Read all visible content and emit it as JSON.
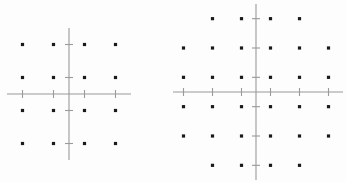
{
  "figure": {
    "title": "",
    "background_color": "#fdfdfd",
    "axis_color": "#9a9a9a",
    "point_color": "#1a1a1a"
  },
  "chart_data": [
    {
      "type": "scatter",
      "name": "16-QAM square constellation",
      "title": "",
      "xlabel": "",
      "ylabel": "",
      "xlim": [
        -4,
        4
      ],
      "ylim": [
        -4,
        4
      ],
      "grid": false,
      "legend": "none",
      "point_count": 16,
      "xticks": [
        -3,
        -1,
        1,
        3
      ],
      "yticks": [
        -3,
        -1,
        1,
        3
      ],
      "x": [
        -3,
        -1,
        1,
        3,
        -3,
        -1,
        1,
        3,
        -3,
        -1,
        1,
        3,
        -3,
        -1,
        1,
        3
      ],
      "y": [
        3,
        3,
        3,
        3,
        1,
        1,
        1,
        1,
        -1,
        -1,
        -1,
        -1,
        -3,
        -3,
        -3,
        -3
      ]
    },
    {
      "type": "scatter",
      "name": "32-QAM cross constellation",
      "title": "",
      "xlabel": "",
      "ylabel": "",
      "xlim": [
        -6,
        6
      ],
      "ylim": [
        -6,
        6
      ],
      "grid": false,
      "legend": "none",
      "point_count": 32,
      "xticks": [
        -5,
        -3,
        -1,
        1,
        3,
        5
      ],
      "yticks": [
        -5,
        -3,
        -1,
        1,
        3,
        5
      ],
      "x": [
        -3,
        -1,
        1,
        3,
        -5,
        -3,
        -1,
        1,
        3,
        5,
        -5,
        -3,
        -1,
        1,
        3,
        5,
        -5,
        -3,
        -1,
        1,
        3,
        5,
        -5,
        -3,
        -1,
        1,
        3,
        5,
        -3,
        -1,
        1,
        3
      ],
      "y": [
        5,
        5,
        5,
        5,
        3,
        3,
        3,
        3,
        3,
        3,
        1,
        1,
        1,
        1,
        1,
        1,
        -1,
        -1,
        -1,
        -1,
        -1,
        -1,
        -3,
        -3,
        -3,
        -3,
        -3,
        -3,
        -5,
        -5,
        -5,
        -5
      ]
    }
  ]
}
